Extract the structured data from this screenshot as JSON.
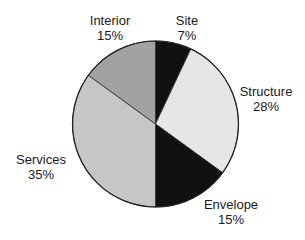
{
  "chart_data": {
    "type": "pie",
    "title": "",
    "categories": [
      "Site",
      "Structure",
      "Envelope",
      "Services",
      "Interior"
    ],
    "values": [
      7,
      28,
      15,
      35,
      15
    ],
    "unit": "%",
    "colors": [
      "#111111",
      "#e6e6e6",
      "#111111",
      "#c6c6c6",
      "#a2a2a2"
    ],
    "start_angle_deg": 0,
    "direction": "clockwise",
    "legend": "none (direct labels)",
    "labels": [
      {
        "name": "Site",
        "pct": "7%"
      },
      {
        "name": "Structure",
        "pct": "28%"
      },
      {
        "name": "Envelope",
        "pct": "15%"
      },
      {
        "name": "Services",
        "pct": "35%"
      },
      {
        "name": "Interior",
        "pct": "15%"
      }
    ]
  }
}
